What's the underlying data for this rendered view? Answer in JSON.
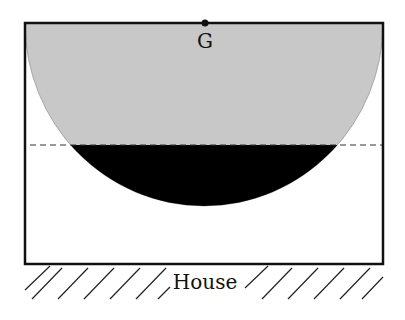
{
  "diagram": {
    "point_label": "G",
    "ground_label": "House",
    "colors": {
      "outline": "#111111",
      "bowl_fill": "#c8c8c8",
      "liquid_fill": "#000000",
      "background": "#ffffff",
      "dashed_line": "#333333"
    },
    "elements": [
      "rectangular box resting on ground",
      "semicircular bowl region hanging from top edge",
      "point G at center of top edge",
      "dashed horizontal level line",
      "black filled lower segment of bowl",
      "hatched ground labelled House"
    ]
  }
}
